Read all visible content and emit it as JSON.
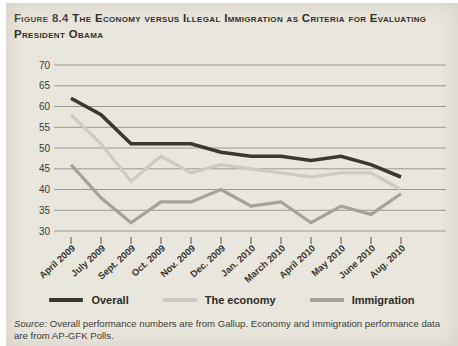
{
  "figure": {
    "label": "Figure 8.4",
    "title": "The Economy versus Illegal Immigration as Criteria for Evaluating President Obama"
  },
  "source_note": {
    "prefix": "Source:",
    "text": " Overall performance numbers are from Gallup. Economy and Immigration performance data are from AP-GFK Polls."
  },
  "colors": {
    "background": "#e9e6dd",
    "gridline": "#9c988e",
    "tick": "#6e6a60",
    "overall": "#3a3831",
    "economy": "#cdcac1",
    "immigration": "#a5a299"
  },
  "chart_data": {
    "type": "line",
    "title": "The Economy versus Illegal Immigration as Criteria for Evaluating President Obama",
    "categories": [
      "April 2009",
      "July 2009",
      "Sept. 2009",
      "Oct. 2009",
      "Nov. 2009",
      "Dec. 2009",
      "Jan. 2010",
      "March 2010",
      "April 2010",
      "May 2010",
      "June 2010",
      "Aug. 2010"
    ],
    "series": [
      {
        "name": "Overall",
        "color": "#3a3831",
        "width": 3.6,
        "values": [
          62,
          58,
          51,
          51,
          51,
          49,
          48,
          48,
          47,
          48,
          46,
          43
        ]
      },
      {
        "name": "The economy",
        "color": "#cdcac1",
        "width": 3.2,
        "values": [
          58,
          51,
          42,
          48,
          44,
          46,
          45,
          44,
          43,
          44,
          44,
          40
        ]
      },
      {
        "name": "Immigration",
        "color": "#a5a299",
        "width": 3.2,
        "values": [
          46,
          38,
          32,
          37,
          37,
          40,
          36,
          37,
          32,
          36,
          34,
          39
        ]
      }
    ],
    "xlabel": "",
    "ylabel": "",
    "ylim": [
      30,
      70
    ],
    "ytick_step": 5,
    "grid": true,
    "legend_position": "bottom"
  }
}
